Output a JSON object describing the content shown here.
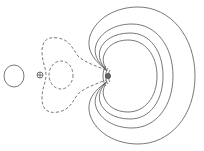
{
  "figure": {
    "type": "contour-plot",
    "colors": {
      "background": "#ffffff",
      "contour_stroke": "#555555"
    },
    "markers": [
      {
        "name": "plus-atom-marker",
        "symbol": "⊕",
        "x": 40,
        "y": 75
      },
      {
        "name": "nucleus-marker",
        "x": 108,
        "y": 76
      }
    ],
    "contours": {
      "solid_left_lobe": {
        "style": "solid",
        "cx": 14,
        "cy": 76,
        "rx": 10,
        "ry": 11
      },
      "dashed_outer": {
        "style": "dashed"
      },
      "dashed_inner": {
        "style": "dashed",
        "cx": 61,
        "cy": 75,
        "rx": 12,
        "ry": 14
      },
      "solid_crescents": [
        {
          "style": "solid",
          "right_x": 195,
          "top_y": 7,
          "bottom_y": 144
        },
        {
          "style": "solid",
          "right_x": 173,
          "top_y": 24,
          "bottom_y": 128
        },
        {
          "style": "solid",
          "right_x": 163,
          "top_y": 33,
          "bottom_y": 119
        },
        {
          "style": "solid",
          "right_x": 157,
          "top_y": 40,
          "bottom_y": 112
        }
      ]
    }
  }
}
